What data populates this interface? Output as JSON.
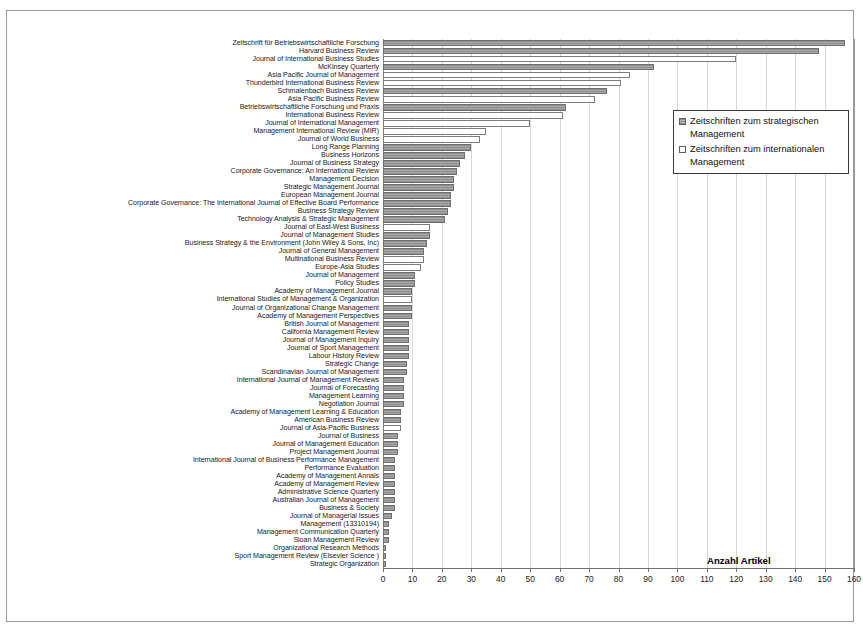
{
  "chart": {
    "type": "bar",
    "orientation": "horizontal",
    "xlabel": "Anzahl Artikel",
    "ylabel": "",
    "title": "",
    "xlim": [
      0,
      160
    ],
    "xticks": [
      0,
      10,
      20,
      30,
      40,
      50,
      60,
      70,
      80,
      90,
      100,
      110,
      120,
      130,
      140,
      150,
      160
    ],
    "grid": true,
    "legend_position": "top-right"
  },
  "legend": {
    "items": [
      {
        "label": "Zeitschriften zum strategischen Management",
        "key": "strategisch",
        "swatch": "hatched-gray",
        "color": "#9a9a9a"
      },
      {
        "label": "Zeitschriften zum internationalen Management",
        "key": "international",
        "swatch": "white",
        "color": "#ffffff"
      }
    ]
  },
  "chart_data": {
    "type": "bar",
    "orientation": "horizontal",
    "title": "",
    "xlabel": "Anzahl Artikel",
    "ylabel": "",
    "xlim": [
      0,
      160
    ],
    "xticks": [
      0,
      10,
      20,
      30,
      40,
      50,
      60,
      70,
      80,
      90,
      100,
      110,
      120,
      130,
      140,
      150,
      160
    ],
    "grid": true,
    "series_names": [
      "Zeitschriften zum strategischen Management",
      "Zeitschriften zum internationalen Management"
    ],
    "categories": [
      "Zeitschrift für Betriebswirtschaftliche Forschung",
      "Harvard Business Review",
      "Journal of International Business Studies",
      "McKinsey Quarterly",
      "Asia Pacific Journal of Management",
      "Thunderbird International Business Review",
      "Schmalenbach Business Review",
      "Asia Pacific Business Review",
      "Betriebswirtschaftliche Forschung und Praxis",
      "International Business Review",
      "Journal of International Management",
      "Management International Review (MIR)",
      "Journal of World Business",
      "Long Range Planning",
      "Business Horizons",
      "Journal of Business Strategy",
      "Corporate Governance: An International Review",
      "Management Decision",
      "Strategic Management Journal",
      "European Management Journal",
      "Corporate Governance: The International Journal of Effective Board Performance",
      "Business Strategy Review",
      "Technology Analysis & Strategic Management",
      "Journal of East-West Business",
      "Journal of Management Studies",
      "Business Strategy & the Environment (John Wiley & Sons, Inc)",
      "Journal of General Management",
      "Multinational Business Review",
      "Europe-Asia Studies",
      "Journal of Management",
      "Policy Studies",
      "Academy of Management Journal",
      "International Studies of Management & Organization",
      "Journal of Organizational Change Management",
      "Academy of Management Perspectives",
      "British Journal of Management",
      "California Management Review",
      "Journal of Management Inquiry",
      "Journal of Sport Management",
      "Labour History Review",
      "Strategic Change",
      "Scandinavian Journal of Management",
      "International Journal of Management Reviews",
      "Journal of Forecasting",
      "Management Learning",
      "Negotiation Journal",
      "Academy of Management Learning & Education",
      "American Business Review",
      "Journal of Asia-Pacific Business",
      "Journal of Business",
      "Journal of Management Education",
      "Project Management Journal",
      "International Journal of Business Performance Management",
      "Performance Evaluation",
      "Academy of Management Annals",
      "Academy of Management Review",
      "Administrative Science Quarterly",
      "Australian Journal of Management",
      "Business & Society",
      "Journal of Managerial Issues",
      "Management (13310194)",
      "Management Communication Quarterly",
      "Sloan Management Review",
      "Organizational Research Methods",
      "Sport Management Review (Elsevier Science )",
      "Strategic Organization"
    ],
    "values": [
      157,
      148,
      120,
      92,
      84,
      81,
      76,
      72,
      62,
      61,
      50,
      35,
      33,
      30,
      28,
      26,
      25,
      24,
      24,
      23,
      23,
      22,
      21,
      16,
      16,
      15,
      14,
      14,
      13,
      11,
      11,
      10,
      10,
      10,
      10,
      9,
      9,
      9,
      9,
      9,
      8,
      8,
      7,
      7,
      7,
      7,
      6,
      6,
      6,
      5,
      5,
      5,
      4,
      4,
      4,
      4,
      4,
      4,
      4,
      3,
      2,
      2,
      2,
      1,
      1,
      1
    ],
    "group": [
      "strategisch",
      "strategisch",
      "international",
      "strategisch",
      "international",
      "international",
      "strategisch",
      "international",
      "strategisch",
      "international",
      "international",
      "international",
      "international",
      "strategisch",
      "strategisch",
      "strategisch",
      "strategisch",
      "strategisch",
      "strategisch",
      "strategisch",
      "strategisch",
      "strategisch",
      "strategisch",
      "international",
      "strategisch",
      "strategisch",
      "strategisch",
      "international",
      "international",
      "strategisch",
      "strategisch",
      "strategisch",
      "international",
      "strategisch",
      "strategisch",
      "strategisch",
      "strategisch",
      "strategisch",
      "strategisch",
      "strategisch",
      "strategisch",
      "strategisch",
      "strategisch",
      "strategisch",
      "strategisch",
      "strategisch",
      "strategisch",
      "strategisch",
      "international",
      "strategisch",
      "strategisch",
      "strategisch",
      "strategisch",
      "strategisch",
      "strategisch",
      "strategisch",
      "strategisch",
      "strategisch",
      "strategisch",
      "strategisch",
      "strategisch",
      "strategisch",
      "strategisch",
      "strategisch",
      "strategisch",
      "strategisch"
    ]
  }
}
